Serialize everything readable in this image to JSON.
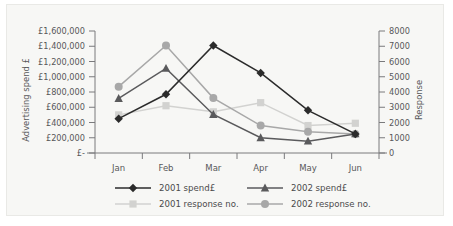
{
  "chart_data": {
    "type": "line",
    "title": "",
    "categories": [
      "Jan",
      "Feb",
      "Mar",
      "Apr",
      "May",
      "Jun"
    ],
    "xlabel": "",
    "ylabel": "Advertising spend £",
    "ylabel_right": "Response",
    "ylim": [
      0,
      1600000
    ],
    "ylim_right": [
      0,
      8000
    ],
    "ytick_labels": [
      "£1,600,000",
      "£1,400,000",
      "£1,200,000",
      "£1,000,000",
      "£800,000",
      "£600,000",
      "£400,000",
      "£200,000",
      "£-"
    ],
    "ytick_values": [
      1600000,
      1400000,
      1200000,
      1000000,
      800000,
      600000,
      400000,
      200000,
      0
    ],
    "y2tick_labels": [
      "8000",
      "7000",
      "6000",
      "5000",
      "4000",
      "3000",
      "2000",
      "1000",
      "0"
    ],
    "y2tick_values": [
      8000,
      7000,
      6000,
      5000,
      4000,
      3000,
      2000,
      1000,
      0
    ],
    "grid": false,
    "legend_position": "bottom",
    "series": [
      {
        "name": "2001 spend£",
        "axis": "left",
        "marker": "diamond",
        "color": "#2b2b2b",
        "values": [
          450000,
          770000,
          1410000,
          1050000,
          560000,
          250000
        ]
      },
      {
        "name": "2002 spend£",
        "axis": "left",
        "marker": "triangle",
        "color": "#5a5a5c",
        "values": [
          715000,
          1110000,
          505000,
          200000,
          155000,
          250000
        ]
      },
      {
        "name": "2001 response no.",
        "axis": "right",
        "marker": "square",
        "color": "#d2d2d0",
        "values": [
          2500,
          3100,
          2700,
          3300,
          1800,
          1950
        ]
      },
      {
        "name": "2002 response no.",
        "axis": "right",
        "marker": "circle",
        "color": "#a8a8a8",
        "values": [
          4350,
          7050,
          3600,
          1800,
          1400,
          1250
        ]
      }
    ]
  },
  "colors": {
    "card_background": "#f7f7f5",
    "page_background": "#ffffff",
    "axis": "#7a7a7c",
    "text": "#58585a"
  }
}
